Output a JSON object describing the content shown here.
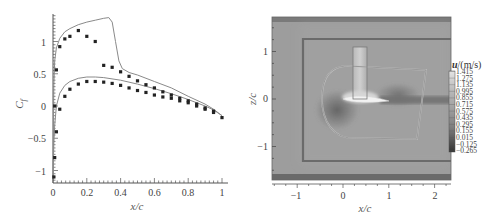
{
  "chart_data": [
    {
      "type": "scatter",
      "title": "",
      "xlabel": "x/c",
      "ylabel": "C_f",
      "xlim": [
        0,
        1
      ],
      "ylim": [
        -1.2,
        1.45
      ],
      "xticks": [
        "0",
        "0.2",
        "0.4",
        "0.6",
        "0.8",
        "1"
      ],
      "yticks": [
        "-1",
        "-0.5",
        "0",
        "0.5",
        "1"
      ],
      "grid": false,
      "legend": null,
      "series": [
        {
          "name": "computed upper surface",
          "kind": "line",
          "x": [
            0.0,
            0.005,
            0.01,
            0.02,
            0.04,
            0.07,
            0.1,
            0.15,
            0.2,
            0.25,
            0.3,
            0.33,
            0.35,
            0.37,
            0.39,
            0.41,
            0.45,
            0.5,
            0.6,
            0.7,
            0.8,
            0.9,
            0.95,
            1.0
          ],
          "y": [
            -1.1,
            0.3,
            0.7,
            0.9,
            1.05,
            1.15,
            1.2,
            1.26,
            1.3,
            1.33,
            1.36,
            1.37,
            1.3,
            1.0,
            0.7,
            0.58,
            0.52,
            0.48,
            0.38,
            0.28,
            0.15,
            0.03,
            -0.05,
            -0.15
          ]
        },
        {
          "name": "computed lower surface",
          "kind": "line",
          "x": [
            0.0,
            0.005,
            0.01,
            0.02,
            0.04,
            0.07,
            0.1,
            0.15,
            0.2,
            0.25,
            0.3,
            0.4,
            0.5,
            0.6,
            0.7,
            0.8,
            0.9,
            0.95,
            1.0
          ],
          "y": [
            -1.1,
            -0.6,
            -0.3,
            0.0,
            0.2,
            0.32,
            0.38,
            0.43,
            0.45,
            0.45,
            0.44,
            0.4,
            0.34,
            0.27,
            0.19,
            0.1,
            0.0,
            -0.06,
            -0.15
          ]
        },
        {
          "name": "experiment upper surface",
          "kind": "markers",
          "x": [
            0.01,
            0.02,
            0.04,
            0.07,
            0.1,
            0.15,
            0.2,
            0.25,
            0.3,
            0.35,
            0.4,
            0.45,
            0.5,
            0.55,
            0.6,
            0.65,
            0.7,
            0.75,
            0.8,
            0.85,
            0.9,
            0.95,
            1.0
          ],
          "y": [
            0.0,
            0.56,
            0.92,
            1.04,
            1.08,
            1.17,
            1.08,
            1.0,
            0.63,
            0.6,
            0.53,
            0.46,
            0.39,
            0.33,
            0.28,
            0.22,
            0.17,
            0.12,
            0.08,
            0.03,
            -0.03,
            -0.08,
            -0.18
          ]
        },
        {
          "name": "experiment lower surface",
          "kind": "markers",
          "x": [
            0.005,
            0.01,
            0.02,
            0.04,
            0.07,
            0.1,
            0.15,
            0.2,
            0.25,
            0.3,
            0.35,
            0.4,
            0.45,
            0.5,
            0.55,
            0.6,
            0.65,
            0.7,
            0.75,
            0.8,
            0.85,
            0.9,
            0.95
          ],
          "y": [
            -1.1,
            -0.8,
            -0.4,
            -0.05,
            0.15,
            0.26,
            0.34,
            0.38,
            0.38,
            0.37,
            0.35,
            0.32,
            0.28,
            0.24,
            0.21,
            0.17,
            0.14,
            0.12,
            0.08,
            0.05,
            0.0,
            -0.05,
            -0.1
          ]
        }
      ]
    },
    {
      "type": "heatmap",
      "title": "",
      "xlabel": "x/c",
      "ylabel": "z/c",
      "xlim": [
        -1.55,
        2.35
      ],
      "ylim": [
        -1.7,
        1.65
      ],
      "xticks": [
        "-1",
        "0",
        "1",
        "2"
      ],
      "yticks": [
        "-1",
        "0",
        "1"
      ],
      "colorbar": {
        "title": "u/(m/s)",
        "levels": [
          "1.415",
          "1.275",
          "1.135",
          "0.995",
          "0.855",
          "0.715",
          "0.575",
          "0.435",
          "0.295",
          "0.155",
          "0.015",
          "-0.125",
          "-0.265"
        ],
        "position": "right"
      },
      "annotations": [
        "outer rectangular grid boundary x: -0.85..2.35, z: -1.3..1.25",
        "C-shaped inner grid region around airfoil x: -0.45..1.7, z: -0.8..0.65",
        "vertical refinement box above airfoil x: 0.2..0.5, z: 0..1.1",
        "airfoil at z≈0, x: 0..1 with high-velocity region on upper surface",
        "low-velocity wake extending downstream from trailing edge"
      ]
    }
  ],
  "left": {
    "xlabel": "x/c",
    "ylabel": "C",
    "ylabel_sub": "f",
    "xticks": [
      "0",
      "0.2",
      "0.4",
      "0.6",
      "0.8",
      "1"
    ],
    "yticks": [
      "1",
      "0.5",
      "0",
      "−0.5",
      "−1"
    ]
  },
  "right": {
    "xlabel": "x/c",
    "ylabel": "z/c",
    "xticks": [
      "−1",
      "0",
      "1",
      "2"
    ],
    "yticks": [
      "1",
      "0",
      "−1"
    ],
    "colorbar_title": "u/(m/s)",
    "colorbar_title_bold": "u",
    "colorbar_title_rest": "/(m/s)",
    "colorbar_levels": [
      "1.415",
      "1.275",
      "1.135",
      "0.995",
      "0.855",
      "0.715",
      "0.575",
      "0.435",
      "0.295",
      "0.155",
      "0.015",
      "−0.125",
      "−0.265"
    ]
  },
  "colors": {
    "axis": "#555555",
    "line": "#8a8a8a",
    "marker": "#222222",
    "field_bg": "#9a9a9a",
    "grid_boundary": "#6e6e6e"
  }
}
